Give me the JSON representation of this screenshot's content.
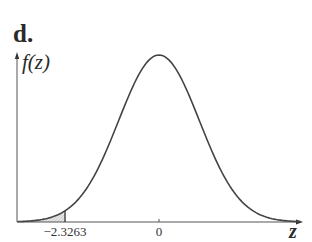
{
  "panel": {
    "label": "d."
  },
  "chart_data": {
    "type": "line",
    "title": "",
    "xlabel": "z",
    "ylabel": "f(z)",
    "x_ticks": [
      {
        "value": -2.3263,
        "label": "−2.3263"
      },
      {
        "value": 0,
        "label": "0"
      }
    ],
    "xlim": [
      -3.5,
      3.5
    ],
    "ylim": [
      0,
      0.4
    ],
    "grid": false,
    "legend": null,
    "series": [
      {
        "name": "standard normal pdf",
        "mean": 0,
        "sd": 1,
        "x": [
          -3.5,
          -3,
          -2.5,
          -2.3263,
          -2,
          -1.5,
          -1,
          -0.5,
          0,
          0.5,
          1,
          1.5,
          2,
          2.5,
          3,
          3.5
        ],
        "y": [
          0.0009,
          0.0044,
          0.0175,
          0.0267,
          0.054,
          0.1295,
          0.242,
          0.3521,
          0.3989,
          0.3521,
          0.242,
          0.1295,
          0.054,
          0.0175,
          0.0044,
          0.0009
        ]
      }
    ],
    "shaded_region": {
      "from": "-inf",
      "to": -2.3263,
      "area": 0.01,
      "side": "left tail"
    },
    "colors": {
      "curve": "#444444",
      "axis": "#555555",
      "shade": "#d9d9d9"
    }
  }
}
